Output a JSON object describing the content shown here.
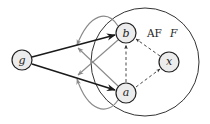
{
  "diagram": {
    "framework_label": {
      "prefix": "AF",
      "name": "F"
    },
    "colors": {
      "bold_edge": "#1a1a1a",
      "dashed_edge": "#333333",
      "gray_edge": "#8a8a8a",
      "node_fill": "#ececec"
    },
    "nodes": [
      {
        "id": "g",
        "label": "g",
        "inside_framework": false
      },
      {
        "id": "b",
        "label": "b",
        "inside_framework": true
      },
      {
        "id": "a",
        "label": "a",
        "inside_framework": true
      },
      {
        "id": "x",
        "label": "x",
        "inside_framework": true
      }
    ],
    "edges": [
      {
        "from": "g",
        "to": "b",
        "style": "bold"
      },
      {
        "from": "g",
        "to": "a",
        "style": "bold"
      },
      {
        "from": "a",
        "to": "b",
        "style": "dashed"
      },
      {
        "from": "x",
        "to": "b",
        "style": "dashed"
      },
      {
        "from": "a",
        "to": "x",
        "style": "dashed"
      },
      {
        "from": "b",
        "to": "edge g->b",
        "style": "gray-curved"
      },
      {
        "from": "b",
        "to": "edge g->a",
        "style": "gray"
      },
      {
        "from": "a",
        "to": "edge g->b",
        "style": "gray"
      },
      {
        "from": "a",
        "to": "edge g->a",
        "style": "gray-curved"
      }
    ]
  }
}
